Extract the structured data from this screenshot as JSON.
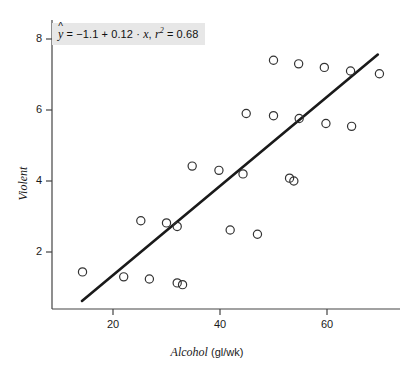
{
  "chart_data": {
    "type": "scatter",
    "title": "",
    "xlabel": "Alcohol (gl/wk)",
    "xlabel_italic": "Alcohol",
    "xlabel_rest": " (gl/wk)",
    "ylabel": "Violent",
    "xlim": [
      9,
      72
    ],
    "ylim": [
      0.35,
      8.6
    ],
    "xticks": [
      20,
      40,
      60
    ],
    "xtick_labels": [
      "20",
      "40",
      "60"
    ],
    "yticks": [
      2,
      4,
      6,
      8
    ],
    "ytick_labels": [
      "2",
      "4",
      "6",
      "8"
    ],
    "grid": false,
    "legend": "none",
    "marker": "open-circle",
    "marker_color": "#333333",
    "annotation": {
      "text": "ŷ = −1.1 + 0.12 · x, r² = 0.68",
      "intercept": -1.1,
      "slope": 0.12,
      "r_squared": 0.68,
      "background": "#e7e7e7"
    },
    "fit_line": {
      "type": "line",
      "color": "#1a1a1a",
      "x_start": 14.2,
      "y_start": 0.62,
      "x_end": 69.5,
      "y_end": 7.56
    },
    "points": [
      {
        "x": 14.3,
        "y": 1.44
      },
      {
        "x": 22.0,
        "y": 1.3
      },
      {
        "x": 26.8,
        "y": 1.24
      },
      {
        "x": 32.0,
        "y": 1.13
      },
      {
        "x": 33.0,
        "y": 1.08
      },
      {
        "x": 25.2,
        "y": 2.88
      },
      {
        "x": 30.0,
        "y": 2.82
      },
      {
        "x": 32.0,
        "y": 2.72
      },
      {
        "x": 41.9,
        "y": 2.62
      },
      {
        "x": 47.0,
        "y": 2.5
      },
      {
        "x": 34.8,
        "y": 4.42
      },
      {
        "x": 39.8,
        "y": 4.3
      },
      {
        "x": 44.3,
        "y": 4.2
      },
      {
        "x": 53.0,
        "y": 4.08
      },
      {
        "x": 53.8,
        "y": 4.0
      },
      {
        "x": 44.9,
        "y": 5.9
      },
      {
        "x": 50.0,
        "y": 5.84
      },
      {
        "x": 54.8,
        "y": 5.76
      },
      {
        "x": 59.8,
        "y": 5.62
      },
      {
        "x": 64.6,
        "y": 5.54
      },
      {
        "x": 50.0,
        "y": 7.4
      },
      {
        "x": 54.7,
        "y": 7.3
      },
      {
        "x": 59.5,
        "y": 7.2
      },
      {
        "x": 64.4,
        "y": 7.1
      },
      {
        "x": 69.8,
        "y": 7.02
      }
    ]
  }
}
